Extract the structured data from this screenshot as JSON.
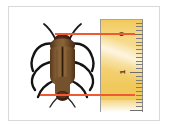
{
  "figure": {
    "background_color": "#ffffff",
    "frame_color": "#d9d9d9"
  },
  "ruler": {
    "name": "measuring-ruler",
    "orientation": "vertical",
    "unit_hint": "cm",
    "body_color": "#f5d57e",
    "edge_color": "#9a9a9a",
    "tick_color": "#7d7d7d",
    "labels": [
      {
        "text": "0",
        "value": 0,
        "y": 34
      },
      {
        "text": "1",
        "value": 1,
        "y": 72
      }
    ],
    "major_tick_count": 2,
    "minor_tick_count": 18
  },
  "measurement": {
    "name": "beetle-length-measurement",
    "line_color": "#e8492b",
    "top_line_label": "head-reference-line",
    "bottom_line_label": "abdomen-reference-line",
    "top_value": "0",
    "bottom_value": "1.6",
    "reading_unit": "cm"
  },
  "subject": {
    "name": "beetle-specimen",
    "body_color": "#6f4b28",
    "elytra_color": "#7c5630",
    "leg_color": "#1c1c1c",
    "head_color": "#3b2414",
    "view": "dorsal"
  }
}
